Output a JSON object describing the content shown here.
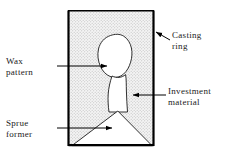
{
  "figure": {
    "colors": {
      "outline": "#1a1a1a",
      "ring_wall": "#000000",
      "investment_fill": "#f2f2f2",
      "investment_stipple": "#b8b8b8",
      "void_fill": "#ffffff",
      "leader": "#000000",
      "text": "#1a1a1a"
    },
    "labels": {
      "wax_pattern": {
        "line1": "Wax",
        "line2": "pattern",
        "leader": "arrow-right",
        "points_to": "wax-pattern-shape"
      },
      "sprue_former": {
        "line1": "Sprue",
        "line2": "former",
        "leader": "arrow-right",
        "points_to": "sprue-former-triangle"
      },
      "casting_ring": {
        "line1": "Casting",
        "line2": "ring",
        "leader": "arrow-up-left",
        "points_to": "casting-ring-wall"
      },
      "investment_material": {
        "line1": "Investment",
        "line2": "material",
        "leader": "arrow-left",
        "points_to": "investment-region"
      }
    },
    "parts": [
      {
        "name": "casting-ring",
        "shape": "rectangle",
        "description": "Outer ring wall, open at top"
      },
      {
        "name": "investment-material",
        "shape": "stippled-fill",
        "description": "Dotted texture filling the ring"
      },
      {
        "name": "wax-pattern",
        "shape": "irregular-blob",
        "description": "Crown-shaped wax pattern, upper area"
      },
      {
        "name": "sprue-channel",
        "shape": "tapered-column",
        "description": "Narrow channel below the pattern"
      },
      {
        "name": "sprue-former",
        "shape": "triangle",
        "description": "Triangular base at the bottom of the ring"
      }
    ]
  }
}
